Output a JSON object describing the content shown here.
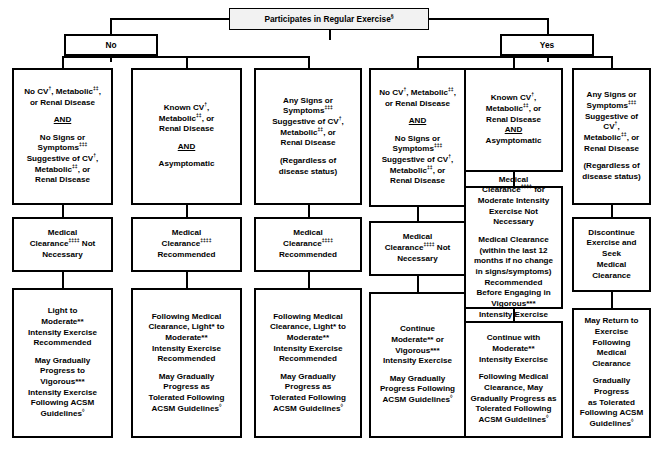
{
  "diagram": {
    "title_box": {
      "label": "Participates in Regular Exercise",
      "sup": "§"
    },
    "branches": {
      "no": "No",
      "yes": "Yes"
    },
    "symbols": {
      "dagger": "†",
      "double_dagger_2": "‡‡",
      "double_dagger_3": "‡‡‡",
      "double_dagger_4": "‡‡‡‡",
      "section": "§",
      "star1": "*",
      "star2": "**",
      "star3": "***",
      "lozenge": "◊"
    },
    "columns": [
      {
        "id": "col1",
        "branch": "No",
        "criteria": {
          "line1_a": "No CV",
          "line1_sup1": "†",
          "line1_b": ", Metabolic",
          "line1_sup2": "‡‡",
          "line1_c": ",",
          "line2": "or Renal Disease",
          "connector": "AND",
          "line3": "No Signs or",
          "line4_a": "Symptoms",
          "line4_sup": "‡‡‡",
          "line5_a": "Suggestive of CV",
          "line5_sup": "†",
          "line5_b": ",",
          "line6_a": "Metabolic",
          "line6_sup": "‡‡",
          "line6_b": ", or",
          "line7": "Renal Disease"
        },
        "clearance": {
          "line1": "Medical",
          "line2_a": "Clearance",
          "line2_sup": "‡‡‡‡",
          "line2_b": " Not",
          "line3": "Necessary"
        },
        "recommendation": {
          "p1_l1": "Light to",
          "p1_l2": "Moderate**",
          "p1_l3": "Intensity Exercise",
          "p1_l4": "Recommended",
          "p2_l1": "May Gradually",
          "p2_l2": "Progress to",
          "p2_l3": "Vigorous***",
          "p2_l4": "Intensity Exercise",
          "p2_l5": "Following ACSM",
          "p2_l6_a": "Guidelines",
          "p2_l6_sup": "◊"
        }
      },
      {
        "id": "col2",
        "branch": "No",
        "criteria": {
          "line1_a": "Known CV",
          "line1_sup": "†",
          "line1_b": ",",
          "line2_a": "Metabolic",
          "line2_sup": "‡‡",
          "line2_b": ", or",
          "line3": "Renal Disease",
          "connector": "AND",
          "line4": "Asymptomatic"
        },
        "clearance": {
          "line1": "Medical",
          "line2_a": "Clearance",
          "line2_sup": "‡‡‡‡",
          "line3": "Recommended"
        },
        "recommendation": {
          "p1_l1": "Following Medical",
          "p1_l2": "Clearance, Light* to",
          "p1_l3": "Moderate**",
          "p1_l4": "Intensity Exercise",
          "p1_l5": "Recommended",
          "p2_l1": "May Gradually",
          "p2_l2": "Progress as",
          "p2_l3": "Tolerated Following",
          "p2_l4_a": "ACSM Guidelines",
          "p2_l4_sup": "◊"
        }
      },
      {
        "id": "col3",
        "branch": "No",
        "criteria": {
          "line1": "Any Signs or",
          "line2_a": "Symptoms",
          "line2_sup": "‡‡‡",
          "line3_a": "Suggestive of CV",
          "line3_sup": "†",
          "line3_b": ",",
          "line4_a": "Metabolic",
          "line4_sup": "‡‡",
          "line4_b": ", or",
          "line5": "Renal Disease",
          "note_l1": "(Regardless of",
          "note_l2": "disease status)"
        },
        "clearance": {
          "line1": "Medical",
          "line2_a": "Clearance",
          "line2_sup": "‡‡‡‡",
          "line3": "Recommended"
        },
        "recommendation": {
          "p1_l1": "Following Medical",
          "p1_l2": "Clearance, Light* to",
          "p1_l3": "Moderate**",
          "p1_l4": "Intensity Exercise",
          "p1_l5": "Recommended",
          "p2_l1": "May Gradually",
          "p2_l2": "Progress as",
          "p2_l3": "Tolerated Following",
          "p2_l4_a": "ACSM Guidelines",
          "p2_l4_sup": "◊"
        }
      },
      {
        "id": "col4",
        "branch": "Yes",
        "criteria": {
          "line1_a": "No CV",
          "line1_sup1": "†",
          "line1_b": ", Metabolic",
          "line1_sup2": "‡‡",
          "line1_c": ",",
          "line2": "or Renal Disease",
          "connector": "AND",
          "line3": "No Signs or",
          "line4_a": "Symptoms",
          "line4_sup": "‡‡‡",
          "line5_a": "Suggestive of CV",
          "line5_sup": "†",
          "line5_b": ",",
          "line6_a": "Metabolic",
          "line6_sup": "‡‡",
          "line6_b": ", or",
          "line7": "Renal Disease"
        },
        "clearance": {
          "line1": "Medical",
          "line2_a": "Clearance",
          "line2_sup": "‡‡‡‡",
          "line2_b": " Not",
          "line3": "Necessary"
        },
        "recommendation": {
          "p1_l1": "Continue",
          "p1_l2": "Moderate** or",
          "p1_l3": "Vigorous***",
          "p1_l4": "Intensity Exercise",
          "p2_l1": "May Gradually",
          "p2_l2": "Progress Following",
          "p2_l3_a": "ACSM Guidelines",
          "p2_l3_sup": "◊"
        }
      },
      {
        "id": "col5",
        "branch": "Yes",
        "criteria": {
          "line1_a": "Known CV",
          "line1_sup": "†",
          "line1_b": ",",
          "line2_a": "Metabolic",
          "line2_sup": "‡‡",
          "line2_b": ", or",
          "line3": "Renal Disease",
          "connector": "AND",
          "line4": "Asymptomatic"
        },
        "clearance": {
          "p1_l1": "Medical",
          "p1_l2_a": "Clearance",
          "p1_l2_sup": "‡‡‡‡",
          "p1_l2_b": " for",
          "p1_l3": "Moderate Intensity",
          "p1_l4": "Exercise Not",
          "p1_l5": "Necessary",
          "p2_l1": "Medical Clearance",
          "p2_l2": "(within the last 12",
          "p2_l3": "months if no change",
          "p2_l4": "in signs/symptoms)",
          "p2_l5": "Recommended",
          "p2_l6": "Before Engaging in",
          "p2_l7": "Vigorous***",
          "p2_l8": "Intensity Exercise"
        },
        "recommendation": {
          "p1_l1": "Continue with",
          "p1_l2": "Moderate**",
          "p1_l3": "Intensity Exercise",
          "p2_l1": "Following Medical",
          "p2_l2": "Clearance, May",
          "p2_l3": "Gradually Progress as",
          "p2_l4": "Tolerated Following",
          "p2_l5_a": "ACSM Guidelines",
          "p2_l5_sup": "◊"
        }
      },
      {
        "id": "col6",
        "branch": "Yes",
        "criteria": {
          "line1": "Any Signs or",
          "line2_a": "Symptoms",
          "line2_sup": "‡‡‡",
          "line3_a": "Suggestive of CV",
          "line3_sup": "†",
          "line3_b": ",",
          "line4_a": "Metabolic",
          "line4_sup": "‡‡",
          "line4_b": ", or",
          "line5": "Renal Disease",
          "note_l1": "(Regardless of",
          "note_l2": "disease status)"
        },
        "clearance": {
          "line1": "Discontinue",
          "line2": "Exercise and Seek",
          "line3": "Medical Clearance"
        },
        "recommendation": {
          "p1_l1": "May Return to",
          "p1_l2": "Exercise Following",
          "p1_l3": "Medical Clearance",
          "p2_l1": "Gradually Progress",
          "p2_l2": "as Tolerated",
          "p2_l3": "Following ACSM",
          "p2_l4_a": "Guidelines",
          "p2_l4_sup": "◊"
        }
      }
    ]
  }
}
